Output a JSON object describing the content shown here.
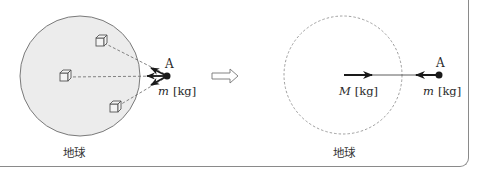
{
  "figure": {
    "left_panel": {
      "body_label": "地球",
      "point_label": "A",
      "mass_label_var": "m",
      "mass_label_unit": "[kg]",
      "cubes": 3
    },
    "transition_icon": "hollow-right-arrow-icon",
    "right_panel": {
      "body_label": "地球",
      "center_mass_var": "M",
      "center_mass_unit": "[kg]",
      "point_label": "A",
      "mass_label_var": "m",
      "mass_label_unit": "[kg]"
    },
    "colors": {
      "earth_fill": "#ececec",
      "outline": "#7a7a7a",
      "ink": "#1a1a1a"
    }
  }
}
